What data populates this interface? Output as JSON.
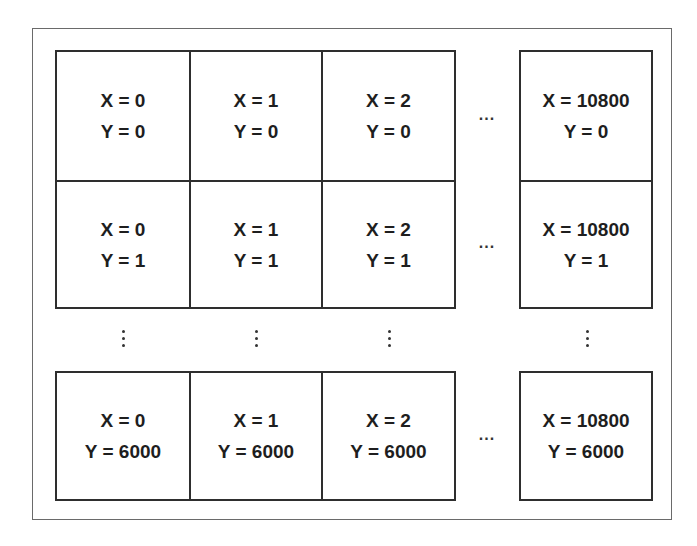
{
  "diagram": {
    "columns": [
      "X = 0",
      "X = 1",
      "X = 2",
      "X = 10800"
    ],
    "column_gap_symbol": "...",
    "row_gap_symbol": "⋮",
    "rows": [
      {
        "cells": [
          {
            "x": "X = 0",
            "y": "Y = 0"
          },
          {
            "x": "X = 1",
            "y": "Y = 0"
          },
          {
            "x": "X = 2",
            "y": "Y = 0"
          },
          {
            "x": "X = 10800",
            "y": "Y = 0"
          }
        ]
      },
      {
        "cells": [
          {
            "x": "X = 0",
            "y": "Y = 1"
          },
          {
            "x": "X = 1",
            "y": "Y = 1"
          },
          {
            "x": "X = 2",
            "y": "Y = 1"
          },
          {
            "x": "X = 10800",
            "y": "Y = 1"
          }
        ]
      },
      {
        "cells": [
          {
            "x": "X = 0",
            "y": "Y = 6000"
          },
          {
            "x": "X = 1",
            "y": "Y = 6000"
          },
          {
            "x": "X = 2",
            "y": "Y = 6000"
          },
          {
            "x": "X = 10800",
            "y": "Y = 6000"
          }
        ]
      }
    ]
  }
}
